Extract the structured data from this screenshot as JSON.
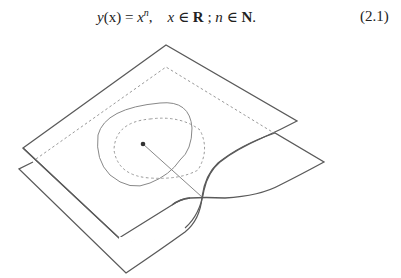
{
  "equation": {
    "lhs_func": "y",
    "lhs_arg": "(x)",
    "equals": " = ",
    "base": "x",
    "exponent": "n",
    "sep1": ",    ",
    "var_x": "x",
    "in1": " ∈ ",
    "set_reals": "R",
    "semicolon": " ; ",
    "var_n": "n",
    "in2": " ∈ ",
    "set_naturals": "N",
    "period": ".",
    "number": "(2.1)"
  },
  "figure": {
    "stroke_dark": "#555555",
    "stroke_light": "#888888",
    "dash_color": "#999999",
    "point_color": "#333333"
  }
}
